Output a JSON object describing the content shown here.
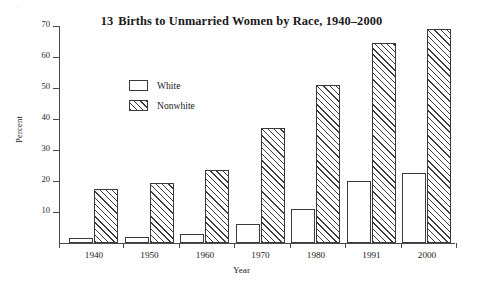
{
  "figure": {
    "title_number": "13",
    "title_text": "Births to Unmarried Women by Race, 1940–2000",
    "scan_artifact": "..",
    "xlabel": "Year",
    "ylabel": "Percent"
  },
  "legend": {
    "position": "top-left inside plot",
    "entries": [
      {
        "label": "White",
        "swatch": "empty-box"
      },
      {
        "label": "Nonwhite",
        "swatch": "diagonal-hatched-box"
      }
    ]
  },
  "axis": {
    "y_ticks": [
      "70",
      "60",
      "50",
      "40",
      "30",
      "20",
      "10"
    ],
    "x_ticks": [
      "1940",
      "1950",
      "1960",
      "1970",
      "1980",
      "1991",
      "2000"
    ]
  },
  "colors": {
    "ink": "#3a3a3a",
    "axis": "#4a4a4a",
    "background": "#ffffff",
    "hatch": "#3d3d3d"
  },
  "chart_data": {
    "type": "bar",
    "xlabel": "Year",
    "ylabel": "Percent",
    "categories": [
      "1940",
      "1950",
      "1960",
      "1970",
      "1980",
      "1991",
      "2000"
    ],
    "series": [
      {
        "name": "White",
        "values": [
          1.5,
          2.0,
          3.0,
          6.0,
          11.0,
          20.0,
          22.5
        ]
      },
      {
        "name": "Nonwhite",
        "values": [
          17.5,
          19.5,
          23.5,
          37.0,
          51.0,
          64.5,
          69.0
        ]
      }
    ],
    "ylim": [
      0,
      72
    ],
    "ytick_values": [
      10,
      20,
      30,
      40,
      50,
      60,
      70
    ],
    "grid": false,
    "legend_position": "upper left"
  }
}
